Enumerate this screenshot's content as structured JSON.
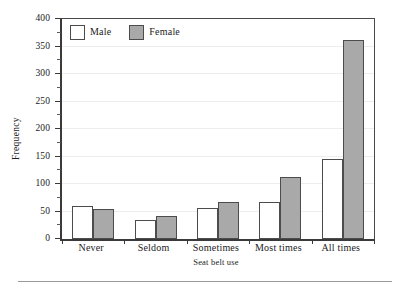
{
  "chart_data": {
    "type": "bar",
    "title": "",
    "xlabel": "Seat belt use",
    "ylabel": "Frequency",
    "categories": [
      "Never",
      "Seldom",
      "Sometimes",
      "Most times",
      "All times"
    ],
    "series": [
      {
        "name": "Male",
        "color": "#ffffff",
        "values": [
          60,
          34,
          56,
          68,
          145
        ]
      },
      {
        "name": "Female",
        "color": "#a9a9a9",
        "values": [
          55,
          41,
          67,
          113,
          361
        ]
      }
    ],
    "ylim": [
      0,
      400
    ],
    "ytick_labels": [
      "0",
      "50",
      "100",
      "150",
      "200",
      "250",
      "300",
      "350",
      "400"
    ],
    "ytick_values": [
      0,
      50,
      100,
      150,
      200,
      250,
      300,
      350,
      400
    ],
    "ytick_minor_values": [
      25,
      75,
      125,
      175,
      225,
      275,
      325,
      375
    ],
    "grid": true,
    "grid_axis": "y",
    "legend_position": "top-left",
    "legend_entries": [
      "Male",
      "Female"
    ],
    "bar_mode": "grouped"
  },
  "axis": {
    "y_title": "Frequency",
    "x_title": "Seat belt use"
  },
  "icons": {
    "male_swatch": "white-square-swatch-icon",
    "female_swatch": "gray-square-swatch-icon"
  }
}
